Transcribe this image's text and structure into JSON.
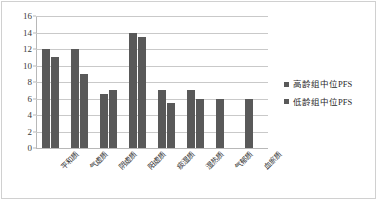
{
  "chart_data": {
    "type": "bar",
    "title": "",
    "xlabel": "",
    "ylabel": "",
    "ylim": [
      0,
      16
    ],
    "yticks": [
      0,
      2,
      4,
      6,
      8,
      10,
      12,
      14,
      16
    ],
    "grid": true,
    "legend_position": "right",
    "categories": [
      "平和质",
      "气虚质",
      "阴虚质",
      "阳虚质",
      "痰湿质",
      "湿热质",
      "气郁质",
      "血瘀质"
    ],
    "series": [
      {
        "name": "高龄组中位PFS",
        "color": "#595959",
        "values": [
          12,
          12,
          6.5,
          14,
          7,
          7,
          6,
          6
        ]
      },
      {
        "name": "低龄组中位PFS",
        "color": "#595959",
        "values": [
          11,
          9,
          7,
          13.5,
          5.5,
          6,
          0,
          0
        ]
      }
    ]
  },
  "legend": {
    "items": [
      {
        "label": "高龄组中位PFS"
      },
      {
        "label": "低龄组中位PFS"
      }
    ]
  }
}
